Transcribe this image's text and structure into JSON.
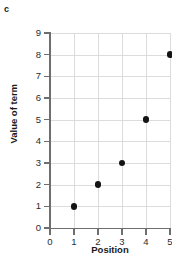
{
  "part_label": "c",
  "chart_data": {
    "type": "scatter",
    "title": "",
    "xlabel": "Position",
    "ylabel": "Value of term",
    "x": [
      1,
      2,
      3,
      4,
      5
    ],
    "values": [
      1,
      2,
      3,
      5,
      8
    ],
    "points": [
      {
        "x": 1,
        "y": 1
      },
      {
        "x": 2,
        "y": 2
      },
      {
        "x": 3,
        "y": 3
      },
      {
        "x": 4,
        "y": 5
      },
      {
        "x": 5,
        "y": 8
      }
    ],
    "xlim": [
      0,
      5
    ],
    "ylim": [
      0,
      9
    ],
    "xticks": [
      0,
      1,
      2,
      3,
      4,
      5
    ],
    "yticks": [
      0,
      1,
      2,
      3,
      4,
      5,
      6,
      7,
      8,
      9
    ],
    "xtick_labels": [
      "0",
      "1",
      "2",
      "3",
      "4",
      "5"
    ],
    "ytick_labels": [
      "0",
      "1",
      "2",
      "3",
      "4",
      "5",
      "6",
      "7",
      "8",
      "9"
    ],
    "grid": true,
    "legend": false,
    "marker_color": "#141414",
    "grid_color": "#dcdcdc",
    "axis_color": "#6e6e6e",
    "background": "#ffffff"
  }
}
